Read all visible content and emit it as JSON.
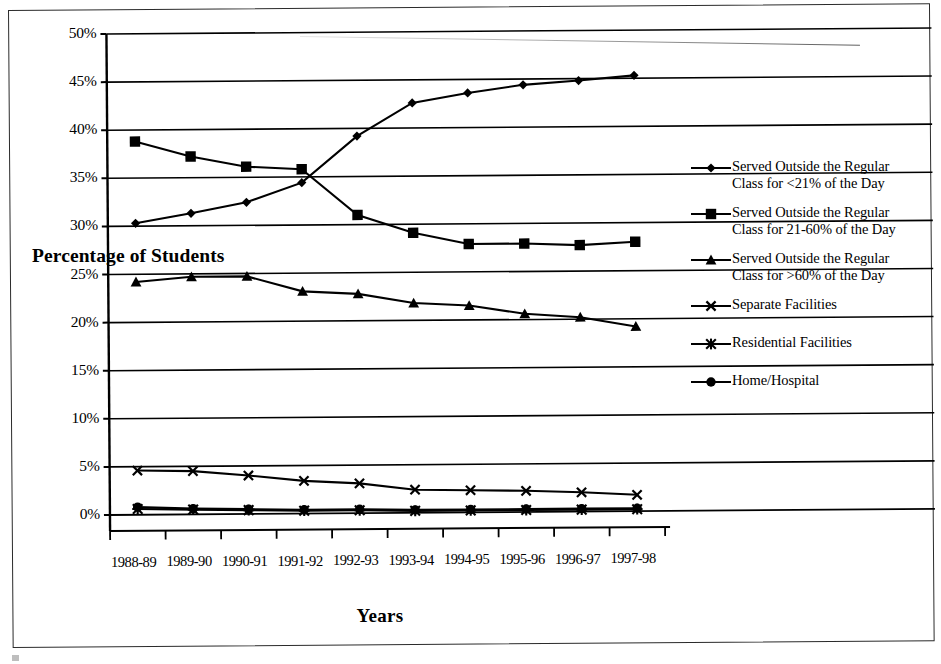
{
  "chart_data": {
    "type": "line",
    "title": "",
    "xlabel": "Years",
    "ylabel": "Percentage of Students",
    "grid": true,
    "legend_position": "right",
    "ylim": [
      0,
      50
    ],
    "ytick_labels": [
      "50%",
      "45%",
      "40%",
      "35%",
      "30%",
      "25%",
      "20%",
      "15%",
      "10%",
      "5%",
      "0%"
    ],
    "ytick_values": [
      50,
      45,
      40,
      35,
      30,
      25,
      20,
      15,
      10,
      5,
      0
    ],
    "categories": [
      "1988-89",
      "1989-90",
      "1990-91",
      "1991-92",
      "1992-93",
      "1993-94",
      "1994-95",
      "1995-96",
      "1996-97",
      "1997-98"
    ],
    "series": [
      {
        "name": "Served Outside the Regular Class for <21% of the Day",
        "marker": "diamond",
        "values": [
          30.3,
          31.3,
          32.4,
          34.4,
          39.2,
          42.6,
          43.6,
          44.4,
          44.8,
          45.3
        ]
      },
      {
        "name": "Served Outside the Regular Class for 21-60% of the Day",
        "marker": "square",
        "values": [
          38.8,
          37.2,
          36.1,
          35.8,
          31.0,
          29.1,
          27.9,
          27.9,
          27.7,
          28.0
        ]
      },
      {
        "name": "Served Outside the Regular Class for >60% of the Day",
        "marker": "triangle",
        "values": [
          24.2,
          24.7,
          24.7,
          23.1,
          22.8,
          21.8,
          21.5,
          20.6,
          20.2,
          19.2
        ]
      },
      {
        "name": "Separate Facilities",
        "marker": "x",
        "values": [
          4.6,
          4.5,
          4.0,
          3.4,
          3.1,
          2.4,
          2.3,
          2.2,
          2.0,
          1.7
        ]
      },
      {
        "name": "Residential Facilities",
        "marker": "asterisk",
        "values": [
          0.6,
          0.5,
          0.4,
          0.3,
          0.3,
          0.2,
          0.2,
          0.2,
          0.2,
          0.2
        ]
      },
      {
        "name": "Home/Hospital",
        "marker": "circle",
        "values": [
          0.8,
          0.6,
          0.5,
          0.4,
          0.4,
          0.3,
          0.3,
          0.3,
          0.3,
          0.3
        ]
      }
    ]
  },
  "legend": {
    "entries": [
      {
        "label": "Served Outside the Regular\nClass for <21% of the Day",
        "marker": "diamond"
      },
      {
        "label": "Served Outside the Regular\nClass for 21-60% of the Day",
        "marker": "square"
      },
      {
        "label": "Served Outside the Regular\nClass for >60% of the Day",
        "marker": "triangle"
      },
      {
        "label": "Separate Facilities",
        "marker": "x"
      },
      {
        "label": "Residential Facilities",
        "marker": "asterisk"
      },
      {
        "label": "Home/Hospital",
        "marker": "circle"
      }
    ]
  },
  "colors": {
    "ink": "#000000",
    "frame": "#2b2b2b",
    "background": "#ffffff"
  }
}
